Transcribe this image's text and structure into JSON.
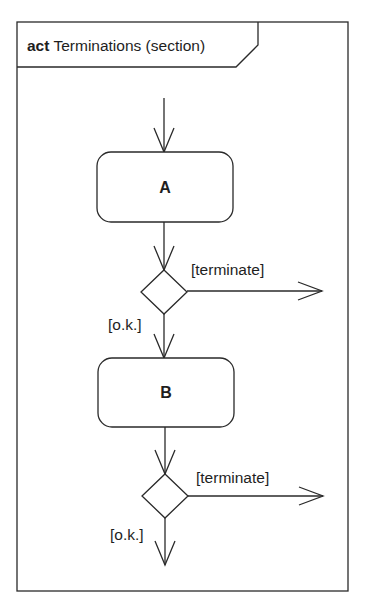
{
  "frame": {
    "keyword": "act",
    "name": "Terminations (section)"
  },
  "actions": [
    {
      "id": "A",
      "label": "A"
    },
    {
      "id": "B",
      "label": "B"
    }
  ],
  "decisions": [
    {
      "id": "decision-1",
      "terminate_guard": "[terminate]",
      "ok_guard": "[o.k.]"
    },
    {
      "id": "decision-2",
      "terminate_guard": "[terminate]",
      "ok_guard": "[o.k.]"
    }
  ],
  "colors": {
    "stroke": "#2a2a2a",
    "background": "#ffffff",
    "text": "#1e1e1e"
  }
}
